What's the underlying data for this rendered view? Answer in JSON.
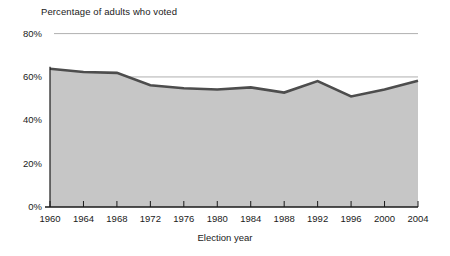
{
  "chart_data": {
    "type": "area",
    "title": "Percentage of adults who voted",
    "xlabel": "Election year",
    "ylabel": "",
    "categories": [
      1960,
      1964,
      1968,
      1972,
      1976,
      1980,
      1984,
      1988,
      1992,
      1996,
      2000,
      2004
    ],
    "values": [
      63.8,
      62.3,
      61.9,
      56.2,
      54.8,
      54.2,
      55.2,
      52.8,
      58.1,
      51.0,
      54.2,
      58.3
    ],
    "x_tick_labels": [
      "1960",
      "1964",
      "1968",
      "1972",
      "1976",
      "1980",
      "1984",
      "1988",
      "1992",
      "1996",
      "2000",
      "2004"
    ],
    "y_tick_labels": [
      "80%",
      "60%",
      "40%",
      "20%",
      "0%"
    ],
    "y_tick_values": [
      80,
      60,
      40,
      20,
      0
    ],
    "ylim": [
      0,
      80
    ],
    "xlim": [
      1960,
      2004
    ],
    "grid": true,
    "gridlines_at": [
      80,
      60
    ],
    "legend": null,
    "series_name": "Percentage of adults who voted",
    "colors": {
      "area_fill": "#c6c6c6",
      "line": "#4d4d4d",
      "gridline": "#9a9a9a",
      "axis": "#1a1a1a",
      "text": "#1a1a1a",
      "background": "#ffffff"
    }
  }
}
